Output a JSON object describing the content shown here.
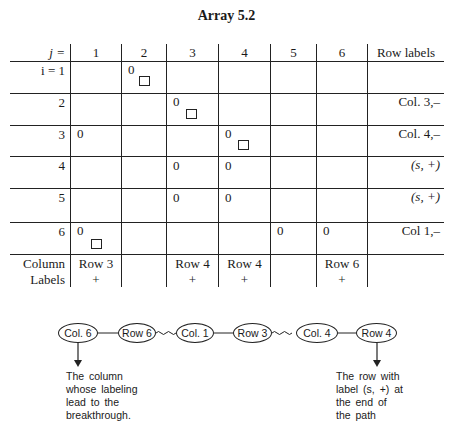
{
  "title": "Array 5.2",
  "table": {
    "corner_header": "j =",
    "column_headers": [
      "1",
      "2",
      "3",
      "4",
      "5",
      "6"
    ],
    "row_labels_header": "Row labels",
    "rows": [
      {
        "i": "i = 1",
        "cells": [
          "",
          "0",
          "",
          "",
          "",
          ""
        ],
        "boxed": [
          2
        ],
        "label": ""
      },
      {
        "i": "2",
        "cells": [
          "",
          "",
          "0",
          "",
          "",
          ""
        ],
        "boxed": [
          3
        ],
        "label": "Col. 3,–"
      },
      {
        "i": "3",
        "cells": [
          "0",
          "",
          "",
          "0",
          "",
          ""
        ],
        "boxed": [
          4
        ],
        "label": "Col. 4,–"
      },
      {
        "i": "4",
        "cells": [
          "",
          "",
          "0",
          "0",
          "",
          ""
        ],
        "boxed": [],
        "label": "(s, +)"
      },
      {
        "i": "5",
        "cells": [
          "",
          "",
          "0",
          "0",
          "",
          ""
        ],
        "boxed": [],
        "label": "(s, +)"
      },
      {
        "i": "6",
        "cells": [
          "0",
          "",
          "",
          "",
          "0",
          "0"
        ],
        "boxed": [
          1
        ],
        "label": "Col 1,–"
      }
    ],
    "column_labels_header": [
      "Column",
      "Labels"
    ],
    "column_labels": [
      {
        "row": "Row 3",
        "sign": "+"
      },
      {
        "row": "",
        "sign": ""
      },
      {
        "row": "Row 4",
        "sign": "+"
      },
      {
        "row": "Row 4",
        "sign": "+"
      },
      {
        "row": "",
        "sign": ""
      },
      {
        "row": "Row 6",
        "sign": "+"
      }
    ]
  },
  "path": {
    "nodes": [
      "Col. 6",
      "Row 6",
      "Col. 1",
      "Row 3",
      "Col. 4",
      "Row 4"
    ],
    "edges": [
      "straight",
      "wavy",
      "straight",
      "wavy",
      "straight"
    ],
    "start_note": [
      "The column",
      "whose labeling",
      "lead to the",
      "breakthrough."
    ],
    "end_note": [
      "The row with",
      "label (s, +) at",
      "the end of",
      "the path"
    ]
  }
}
